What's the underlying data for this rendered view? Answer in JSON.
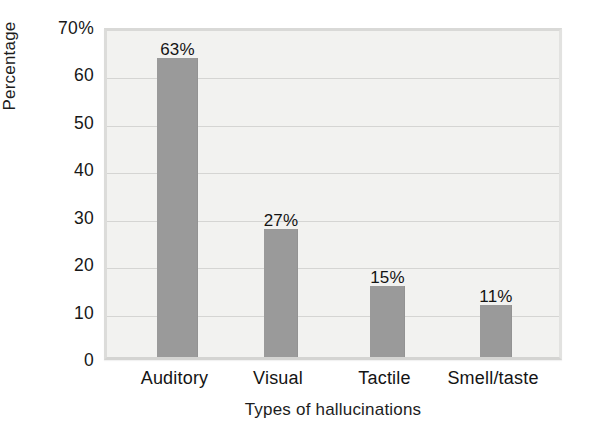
{
  "chart_data": {
    "type": "bar",
    "title": "",
    "categories": [
      "Auditory",
      "Visual",
      "Tactile",
      "Smell/taste"
    ],
    "values": [
      63,
      27,
      15,
      11
    ],
    "data_labels": [
      "63%",
      "27%",
      "15%",
      "11%"
    ],
    "xlabel": "Types of hallucinations",
    "ylabel": "Percentage",
    "ylim": [
      0,
      70
    ],
    "ytick_values": [
      70,
      60,
      50,
      40,
      30,
      20,
      10,
      0
    ],
    "ytick_labels": [
      "70%",
      "60",
      "50",
      "40",
      "30",
      "20",
      "10",
      "0"
    ],
    "grid": true,
    "legend": false,
    "colors": {
      "bar": "#9a9a9a",
      "plot_background": "#f2f2f0",
      "gridline": "#d5d5d3",
      "figure_background": "#ffffff",
      "text": "#141414"
    }
  }
}
